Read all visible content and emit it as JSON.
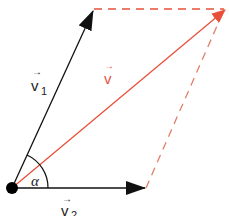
{
  "diagram": {
    "type": "vector-parallelogram",
    "colors": {
      "component": "#111111",
      "resultant": "#e8503a",
      "dashed": "#e8503a"
    },
    "origin": {
      "x": 12,
      "y": 188
    },
    "vectors": [
      {
        "id": "v1",
        "label": "v",
        "subscript": "1",
        "from": [
          12,
          188
        ],
        "to": [
          94,
          9
        ],
        "color": "#111111"
      },
      {
        "id": "v2",
        "label": "v",
        "subscript": "2",
        "from": [
          12,
          188
        ],
        "to": [
          146,
          188
        ],
        "color": "#111111"
      },
      {
        "id": "v",
        "label": "v",
        "subscript": "",
        "from": [
          12,
          188
        ],
        "to": [
          226,
          9
        ],
        "color": "#e8503a"
      }
    ],
    "dashed_lines": [
      {
        "from": [
          94,
          9
        ],
        "to": [
          226,
          9
        ]
      },
      {
        "from": [
          146,
          188
        ],
        "to": [
          226,
          9
        ]
      }
    ],
    "angle": {
      "label": "α",
      "between": [
        "v1",
        "v2"
      ]
    },
    "labels": {
      "v1": "v",
      "v1_sub": "1",
      "v2": "v",
      "v2_sub": "2",
      "v": "v",
      "alpha": "α",
      "arrow": "→"
    }
  }
}
